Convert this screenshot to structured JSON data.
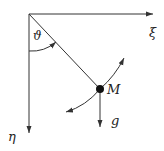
{
  "diagram": {
    "type": "pendulum",
    "labels": {
      "xi_axis": "ξ",
      "eta_axis": "η",
      "angle": "ϑ",
      "mass": "M",
      "gravity": "g"
    },
    "colors": {
      "stroke": "#333333",
      "mass": "#111111",
      "background": "#ffffff"
    }
  }
}
